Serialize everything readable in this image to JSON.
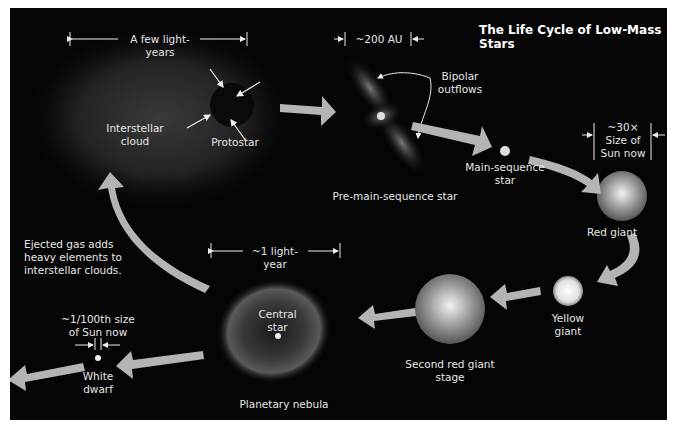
{
  "title": "The Life Cycle of Low-Mass Stars",
  "colors": {
    "background": "#050505",
    "arrow": "#b4b4b4",
    "text": "#e6e6e6",
    "border": "#ffffff"
  },
  "stages": [
    {
      "label": "Interstellar\ncloud"
    },
    {
      "label": "Protostar"
    },
    {
      "label": "Pre-main-sequence star"
    },
    {
      "label": "Main-sequence\nstar"
    },
    {
      "label": "Red giant"
    },
    {
      "label": "Yellow\ngiant"
    },
    {
      "label": "Second red giant stage"
    },
    {
      "label": "Planetary nebula"
    },
    {
      "label": "White\ndwarf"
    }
  ],
  "annotations": {
    "cloud_scale": "A few light-years",
    "premain_scale": "~200 AU",
    "bipolar": "Bipolar\noutflows",
    "redgiant_scale": "~30×\nSize of\nSun now",
    "nebula_scale": "~1 light-year",
    "central_star": "Central\nstar",
    "whitedwarf_scale": "~1/100th size\nof Sun now",
    "ejected_gas": "Ejected gas adds\nheavy elements to\ninterstellar clouds."
  }
}
